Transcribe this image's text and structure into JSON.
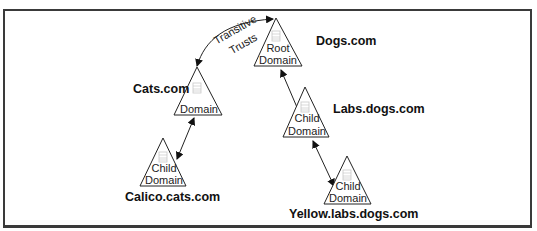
{
  "diagram": {
    "edge_label": {
      "line1": "Transitive",
      "line2": "Trusts"
    },
    "nodes": [
      {
        "id": "dogs",
        "name": "Dogs.com",
        "line1": "Root",
        "line2": "Domain"
      },
      {
        "id": "cats",
        "name": "Cats.com",
        "line1": "",
        "line2": "Domain"
      },
      {
        "id": "labs",
        "name": "Labs.dogs.com",
        "line1": "Child",
        "line2": "Domain"
      },
      {
        "id": "calico",
        "name": "Calico.cats.com",
        "line1": "Child",
        "line2": "Domain"
      },
      {
        "id": "yellow",
        "name": "Yellow.labs.dogs.com",
        "line1": "Child",
        "line2": "Domain"
      }
    ],
    "edges": [
      {
        "from": "dogs",
        "to": "cats",
        "type": "transitive-trust",
        "bidirectional": true
      },
      {
        "from": "dogs",
        "to": "labs",
        "bidirectional": true
      },
      {
        "from": "labs",
        "to": "yellow",
        "bidirectional": true
      },
      {
        "from": "cats",
        "to": "calico",
        "bidirectional": true
      }
    ],
    "node_icon": "server-icon"
  }
}
